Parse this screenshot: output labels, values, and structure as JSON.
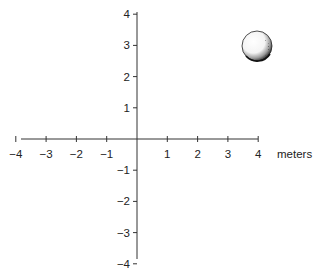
{
  "figure": {
    "type": "coordinate-plane",
    "origin_px": [
      137,
      139
    ],
    "unit_px_x": 30.3,
    "unit_px_y": 31.2,
    "axis_color": "#333333",
    "text_color": "#222222"
  },
  "x_axis": {
    "range": [
      -4,
      4
    ],
    "ticks": [
      -4,
      -3,
      -2,
      -1,
      1,
      2,
      3,
      4
    ],
    "tick_labels": [
      "−4",
      "−3",
      "−2",
      "−1",
      "1",
      "2",
      "3",
      "4"
    ],
    "unit_label": "meters"
  },
  "y_axis": {
    "range": [
      -4,
      4
    ],
    "ticks": [
      4,
      3,
      2,
      1,
      -1,
      -2,
      -3,
      -4
    ],
    "tick_labels": [
      "4",
      "3",
      "2",
      "1",
      "−1",
      "−2",
      "−3",
      "−4"
    ]
  },
  "ball": {
    "label": "golf-ball",
    "position": [
      4,
      3
    ]
  },
  "chart_data": {
    "type": "scatter",
    "title": "",
    "xlabel": "meters",
    "ylabel": "",
    "xlim": [
      -4,
      4
    ],
    "ylim": [
      -4,
      4
    ],
    "x_ticks": [
      -4,
      -3,
      -2,
      -1,
      1,
      2,
      3,
      4
    ],
    "y_ticks": [
      -4,
      -3,
      -2,
      -1,
      1,
      2,
      3,
      4
    ],
    "grid": false,
    "legend": null,
    "series": [
      {
        "name": "golf ball",
        "x": [
          4
        ],
        "y": [
          3
        ]
      }
    ]
  }
}
